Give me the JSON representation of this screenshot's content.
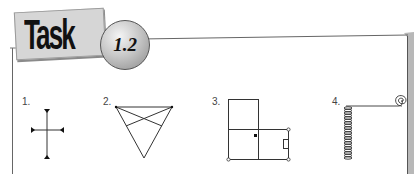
{
  "header": {
    "title": "Task",
    "badge_number": "1.2"
  },
  "items": [
    {
      "label": "1.",
      "figure": "cross-with-arrowheads"
    },
    {
      "label": "2.",
      "figure": "inverted-triangle-with-crossing-lines"
    },
    {
      "label": "3.",
      "figure": "rectangle-grid-with-dot-and-small-box"
    },
    {
      "label": "4.",
      "figure": "coiled-spring-with-spiral"
    }
  ],
  "colors": {
    "frame": "#555555",
    "frame_shadow": "#b4b4b4",
    "card": "#d6d6d6",
    "ink": "#222222"
  }
}
